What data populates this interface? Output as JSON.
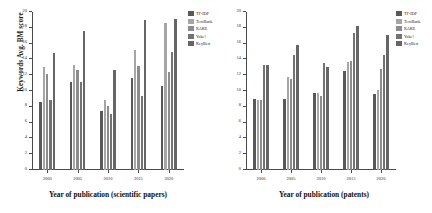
{
  "figure": {
    "background": "#ffffff",
    "series_colors": [
      "#595959",
      "#a6a6a6",
      "#8c8c8c",
      "#737373",
      "#666666"
    ]
  },
  "legend": {
    "position": "right",
    "entries": [
      {
        "label": "TF-IDF",
        "color": "#595959"
      },
      {
        "label": "TextRank",
        "color": "#a6a6a6"
      },
      {
        "label": "RAKE",
        "color": "#8c8c8c"
      },
      {
        "label": "Yake!",
        "color": "#737373"
      },
      {
        "label": "KeyBert",
        "color": "#666666"
      }
    ]
  },
  "chart_data": [
    {
      "type": "bar",
      "title": "",
      "xlabel": "Year of publication (scientific papers)",
      "ylabel": "Keywords Avg. BM score",
      "categories": [
        "2000",
        "2005",
        "2010",
        "2015",
        "2020"
      ],
      "ylim": [
        0,
        20
      ],
      "yticks": [
        0,
        2,
        4,
        6,
        8,
        10,
        12,
        14,
        16,
        18,
        20
      ],
      "grid": false,
      "legend_position": "right",
      "series": [
        {
          "name": "TF-IDF",
          "color": "#595959",
          "values": [
            8.6,
            11.2,
            7.5,
            11.7,
            10.6
          ]
        },
        {
          "name": "TextRank",
          "color": "#a6a6a6",
          "values": [
            13.0,
            13.3,
            8.8,
            15.2,
            18.6
          ]
        },
        {
          "name": "RAKE",
          "color": "#8c8c8c",
          "values": [
            12.1,
            12.6,
            8.1,
            13.2,
            12.4
          ]
        },
        {
          "name": "Yake!",
          "color": "#737373",
          "values": [
            8.9,
            11.2,
            7.1,
            9.4,
            15.0
          ]
        },
        {
          "name": "KeyBert",
          "color": "#666666",
          "values": [
            14.8,
            17.6,
            12.6,
            19.0,
            19.1
          ]
        }
      ]
    },
    {
      "type": "bar",
      "title": "",
      "xlabel": "Year of publication (patents)",
      "ylabel": "Keywords Avg. BM score",
      "categories": [
        "2000",
        "2005",
        "2010",
        "2015",
        "2020"
      ],
      "ylim": [
        0,
        20
      ],
      "yticks": [
        0,
        2,
        4,
        6,
        8,
        10,
        12,
        14,
        16,
        18,
        20
      ],
      "grid": false,
      "legend_position": "right",
      "series": [
        {
          "name": "TF-IDF",
          "color": "#595959",
          "values": [
            9.0,
            9.0,
            9.8,
            12.5,
            9.6
          ]
        },
        {
          "name": "TextRank",
          "color": "#a6a6a6",
          "values": [
            8.9,
            11.8,
            9.7,
            13.7,
            10.1
          ]
        },
        {
          "name": "RAKE",
          "color": "#8c8c8c",
          "values": [
            8.8,
            11.5,
            9.4,
            13.8,
            12.8
          ]
        },
        {
          "name": "Yake!",
          "color": "#737373",
          "values": [
            13.3,
            14.5,
            13.5,
            17.4,
            14.5
          ]
        },
        {
          "name": "KeyBert",
          "color": "#666666",
          "values": [
            13.3,
            15.8,
            13.0,
            18.2,
            17.1
          ]
        }
      ]
    }
  ]
}
